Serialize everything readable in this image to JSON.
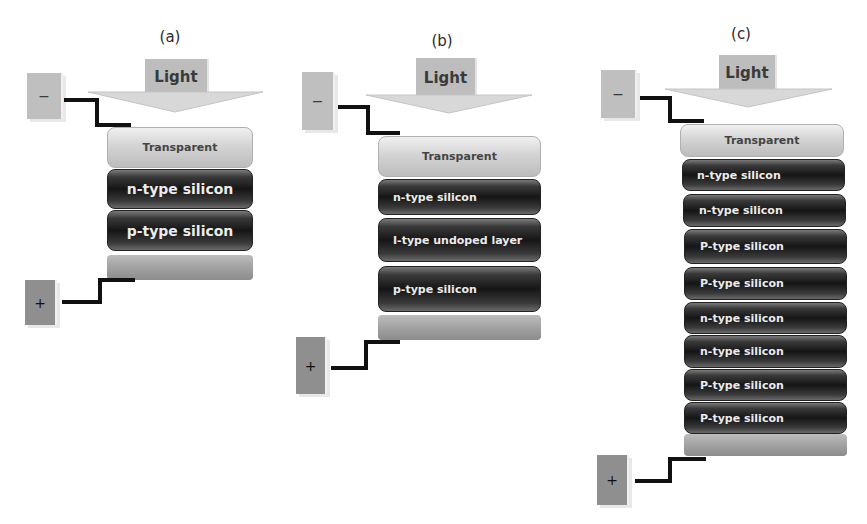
{
  "figure": {
    "panels": [
      {
        "id": "a",
        "label": "(a)",
        "light_label": "Light",
        "negative_terminal": "−",
        "positive_terminal": "+",
        "layers": [
          "Transparent",
          "n-type silicon",
          "p-type silicon",
          ""
        ]
      },
      {
        "id": "b",
        "label": "(b)",
        "light_label": "Light",
        "negative_terminal": "−",
        "positive_terminal": "+",
        "layers": [
          "Transparent",
          "n-type silicon",
          "I-type undoped layer",
          "p-type silicon",
          ""
        ]
      },
      {
        "id": "c",
        "label": "(c)",
        "light_label": "Light",
        "negative_terminal": "−",
        "positive_terminal": "+",
        "layers": [
          "Transparent",
          "n-type silicon",
          "n-type silicon",
          "P-type silicon",
          "P-type silicon",
          "n-type silicon",
          "n-type silicon",
          "P-type silicon",
          "P-type silicon",
          ""
        ]
      }
    ],
    "colors": {
      "transparent_layer": "#d4d4d4",
      "silicon_layer": "#1e1e1e",
      "base_layer": "#a2a2a2",
      "wire": "#111111",
      "light_box": "#bdbdbd"
    }
  }
}
